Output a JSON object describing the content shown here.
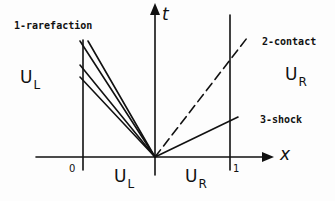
{
  "diagram": {
    "axes": {
      "t_label": "t",
      "x_label": "x",
      "ticks": {
        "left": "0",
        "right": "1"
      }
    },
    "waves": [
      {
        "id": "rarefaction",
        "label": "1-rarefaction",
        "style": "fan of solid lines",
        "count": 4
      },
      {
        "id": "contact",
        "label": "2-contact",
        "style": "dashed"
      },
      {
        "id": "shock",
        "label": "3-shock",
        "style": "solid"
      }
    ],
    "states": {
      "upper_left": {
        "main": "U",
        "sub": "L"
      },
      "upper_right": {
        "main": "U",
        "sub": "R"
      },
      "lower_left": {
        "main": "U",
        "sub": "L"
      },
      "lower_right": {
        "main": "U",
        "sub": "R"
      }
    },
    "colors": {
      "ink": "#111111",
      "background": "#fdfdfd"
    }
  }
}
